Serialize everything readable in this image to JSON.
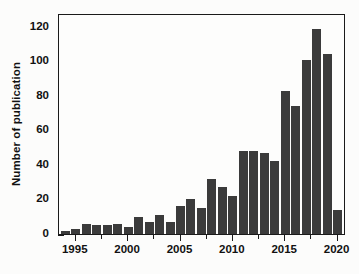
{
  "chart_data": {
    "type": "bar",
    "title": "",
    "xlabel": "",
    "ylabel": "Number of publication",
    "xlim": [
      1993.4,
      2020.8
    ],
    "ylim": [
      0,
      128
    ],
    "grid": false,
    "legend": null,
    "bar_color": "#3b3b3b",
    "frame_color": "#1a1a1a",
    "background": "#fdfdfc",
    "ytick_labels": [
      "0",
      "20",
      "40",
      "60",
      "80",
      "100",
      "120"
    ],
    "ytick_values": [
      0,
      20,
      40,
      60,
      80,
      100,
      120
    ],
    "ytick_minor_values": [
      10,
      30,
      50,
      70,
      90,
      110
    ],
    "xtick_labels": [
      "1995",
      "2000",
      "2005",
      "2010",
      "2015",
      "2020"
    ],
    "xtick_values": [
      1995,
      2000,
      2005,
      2010,
      2015,
      2020
    ],
    "xtick_minor_values": [
      1997.5,
      2002.5,
      2007.5,
      2012.5,
      2017.5
    ],
    "categories": [
      1994,
      1995,
      1996,
      1997,
      1998,
      1999,
      2000,
      2001,
      2002,
      2003,
      2004,
      2005,
      2006,
      2007,
      2008,
      2009,
      2010,
      2011,
      2012,
      2013,
      2014,
      2015,
      2016,
      2017,
      2018,
      2019,
      2020
    ],
    "values": [
      2,
      3,
      6,
      5,
      5,
      6,
      4,
      10,
      7,
      11,
      7,
      16,
      20,
      15,
      32,
      27,
      22,
      48,
      48,
      47,
      42,
      83,
      74,
      101,
      119,
      104,
      14
    ]
  }
}
